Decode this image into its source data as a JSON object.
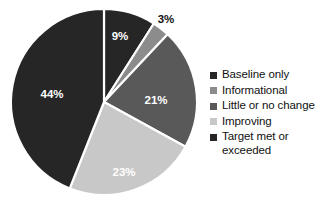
{
  "chart_data": {
    "type": "pie",
    "title": "",
    "legend_position": "right",
    "start_angle_deg": 0,
    "direction": "clockwise",
    "categories": [
      "Baseline only",
      "Informational",
      "Little or no change",
      "Improving",
      "Target met or exceeded"
    ],
    "values": [
      9,
      3,
      21,
      23,
      44
    ],
    "value_labels": [
      "9%",
      "3%",
      "21%",
      "23%",
      "44%"
    ],
    "colors": [
      "#262626",
      "#8c8c8c",
      "#595959",
      "#c8c8c8",
      "#262626"
    ],
    "slices": [
      {
        "label": "Baseline only",
        "value": 9,
        "value_label": "9%",
        "color": "#262626",
        "label_color": "#ffffff",
        "label_placement": "inside",
        "label_x": 120,
        "label_y": 37
      },
      {
        "label": "Informational",
        "value": 3,
        "value_label": "3%",
        "color": "#8c8c8c",
        "label_color": "#111111",
        "label_placement": "outside",
        "label_x": 166,
        "label_y": 20
      },
      {
        "label": "Little or no change",
        "value": 21,
        "value_label": "21%",
        "color": "#595959",
        "label_color": "#ffffff",
        "label_placement": "inside",
        "label_x": 156,
        "label_y": 101
      },
      {
        "label": "Improving",
        "value": 23,
        "value_label": "23%",
        "color": "#c8c8c8",
        "label_color": "#ffffff",
        "label_placement": "inside",
        "label_x": 124,
        "label_y": 173
      },
      {
        "label": "Target met or exceeded",
        "value": 44,
        "value_label": "44%",
        "color": "#262626",
        "label_color": "#ffffff",
        "label_placement": "inside",
        "label_x": 52,
        "label_y": 95
      }
    ],
    "separator_color": "#ffffff",
    "background": "#ffffff"
  },
  "legend": {
    "items": [
      {
        "label": "Baseline only",
        "color": "#262626"
      },
      {
        "label": "Informational",
        "color": "#8c8c8c"
      },
      {
        "label": "Little or no change",
        "color": "#595959"
      },
      {
        "label": "Improving",
        "color": "#c8c8c8"
      },
      {
        "label": "Target met or exceeded",
        "color": "#262626"
      }
    ]
  }
}
